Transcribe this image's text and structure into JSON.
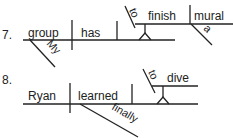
{
  "diagrams": [
    {
      "number": "7.",
      "subject": "group",
      "verb": "has",
      "object_phrase": {
        "infinitive_marker": "to",
        "verb": "finish",
        "object": "mural",
        "object_modifier": "a"
      },
      "subject_modifier": "My"
    },
    {
      "number": "8.",
      "subject": "Ryan",
      "verb": "learned",
      "object_phrase": {
        "infinitive_marker": "to",
        "verb": "dive"
      },
      "verb_modifier": "finally"
    }
  ]
}
